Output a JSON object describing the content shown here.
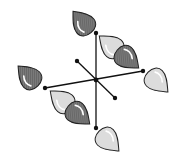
{
  "diagram": {
    "colors": {
      "dark_lobe": "#6e6e6e",
      "light_lobe": "#dcdcdc",
      "line": "#111111",
      "background": "#ffffff"
    },
    "center": [
      96,
      80
    ],
    "bonds": [
      {
        "id": "vertical",
        "from": [
          96,
          33
        ],
        "to": [
          96,
          128
        ]
      },
      {
        "id": "horizontal",
        "from": [
          45,
          88
        ],
        "to": [
          143,
          71
        ]
      },
      {
        "id": "diagonal",
        "from": [
          77,
          61
        ],
        "to": [
          115,
          98
        ]
      }
    ],
    "lobes": [
      {
        "id": "top-dark",
        "shade": "dark",
        "cx": 82,
        "cy": 22,
        "rot": -40
      },
      {
        "id": "top-right-light",
        "shade": "light",
        "cx": 110,
        "cy": 45,
        "rot": -50
      },
      {
        "id": "top-right-dark",
        "shade": "dark",
        "cx": 128,
        "cy": 59,
        "rot": 130
      },
      {
        "id": "left-dark",
        "shade": "dark",
        "cx": 28,
        "cy": 76,
        "rot": -45
      },
      {
        "id": "right-light",
        "shade": "light",
        "cx": 158,
        "cy": 82,
        "rot": 135
      },
      {
        "id": "bottom-left-light",
        "shade": "light",
        "cx": 61,
        "cy": 100,
        "rot": -50
      },
      {
        "id": "bottom-left-dark",
        "shade": "dark",
        "cx": 79,
        "cy": 115,
        "rot": 130
      },
      {
        "id": "bottom-light",
        "shade": "light",
        "cx": 109,
        "cy": 141,
        "rot": 135
      }
    ]
  }
}
